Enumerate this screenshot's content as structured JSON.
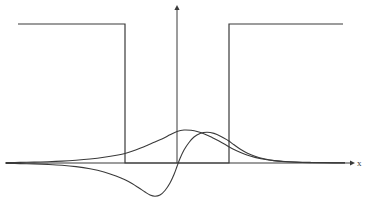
{
  "figure": {
    "title": "",
    "background_color": "#ffffff",
    "line_color": "#3a3a3a",
    "width": 369,
    "height": 205
  },
  "axes": {
    "x_axis": {
      "label": "x",
      "label_x": 357,
      "label_y": 166,
      "start_x": 5,
      "end_x": 350,
      "y": 163,
      "arrow": "right-arrow",
      "color": "#3a3a3a"
    },
    "y_axis": {
      "label": "",
      "x": 177,
      "start_y": 163,
      "end_y": 10,
      "arrow": "up-arrow",
      "color": "#3a3a3a"
    }
  },
  "chart_data": {
    "type": "line",
    "title": "",
    "xlabel": "x",
    "ylabel": "",
    "grid": false,
    "legend": "none",
    "xlim": [
      0,
      369
    ],
    "ylim": [
      205,
      0
    ],
    "baseline_y": 163,
    "series": [
      {
        "name": "potential-barrier",
        "kind": "step",
        "color": "#3a3a3a",
        "stroke_width": 1.2,
        "points": [
          [
            18,
            24
          ],
          [
            125,
            24
          ],
          [
            125,
            163
          ],
          [
            229,
            163
          ],
          [
            229,
            24
          ],
          [
            343,
            24
          ]
        ]
      },
      {
        "name": "wavefunction-even",
        "kind": "curve",
        "color": "#3a3a3a",
        "stroke_width": 1.1,
        "peak_x": 177,
        "peak_y": 130,
        "points": [
          [
            6,
            162.6
          ],
          [
            20,
            162.4
          ],
          [
            34,
            162.1
          ],
          [
            48,
            161.7
          ],
          [
            62,
            161.1
          ],
          [
            76,
            160.2
          ],
          [
            90,
            159.0
          ],
          [
            104,
            157.3
          ],
          [
            118,
            155.0
          ],
          [
            125,
            153.5
          ],
          [
            132,
            151.3
          ],
          [
            140,
            148.3
          ],
          [
            148,
            145.0
          ],
          [
            156,
            141.5
          ],
          [
            164,
            138.0
          ],
          [
            170,
            134.8
          ],
          [
            177,
            131.5
          ],
          [
            184,
            130.0
          ],
          [
            191,
            130.3
          ],
          [
            198,
            131.8
          ],
          [
            205,
            134.2
          ],
          [
            212,
            137.4
          ],
          [
            219,
            141.0
          ],
          [
            226,
            145.0
          ],
          [
            229,
            146.8
          ],
          [
            234,
            149.5
          ],
          [
            240,
            152.2
          ],
          [
            247,
            155.0
          ],
          [
            255,
            157.4
          ],
          [
            264,
            159.3
          ],
          [
            274,
            160.6
          ],
          [
            285,
            161.5
          ],
          [
            297,
            162.1
          ],
          [
            310,
            162.4
          ],
          [
            325,
            162.6
          ],
          [
            345,
            162.8
          ]
        ]
      },
      {
        "name": "wavefunction-odd",
        "kind": "curve",
        "color": "#3a3a3a",
        "stroke_width": 1.1,
        "peak_x": 207,
        "peak_y": 132,
        "trough_x": 150,
        "trough_y": 196,
        "node_x": 177,
        "points": [
          [
            6,
            163.4
          ],
          [
            20,
            163.6
          ],
          [
            34,
            163.9
          ],
          [
            48,
            164.4
          ],
          [
            62,
            165.2
          ],
          [
            76,
            166.6
          ],
          [
            90,
            168.8
          ],
          [
            104,
            172.0
          ],
          [
            116,
            176.0
          ],
          [
            125,
            179.8
          ],
          [
            132,
            183.5
          ],
          [
            139,
            188.0
          ],
          [
            145,
            192.0
          ],
          [
            150,
            195.0
          ],
          [
            155,
            196.2
          ],
          [
            160,
            195.0
          ],
          [
            165,
            190.5
          ],
          [
            170,
            183.0
          ],
          [
            174,
            174.5
          ],
          [
            177,
            166.5
          ],
          [
            180,
            158.5
          ],
          [
            184,
            150.0
          ],
          [
            189,
            142.5
          ],
          [
            194,
            137.0
          ],
          [
            200,
            133.5
          ],
          [
            207,
            132.2
          ],
          [
            214,
            133.4
          ],
          [
            221,
            136.4
          ],
          [
            228,
            140.4
          ],
          [
            229,
            141.0
          ],
          [
            234,
            144.8
          ],
          [
            240,
            149.0
          ],
          [
            247,
            152.9
          ],
          [
            255,
            156.2
          ],
          [
            264,
            158.8
          ],
          [
            274,
            160.6
          ],
          [
            285,
            161.7
          ],
          [
            297,
            162.3
          ],
          [
            310,
            162.6
          ],
          [
            325,
            162.8
          ],
          [
            345,
            162.9
          ]
        ]
      }
    ]
  }
}
